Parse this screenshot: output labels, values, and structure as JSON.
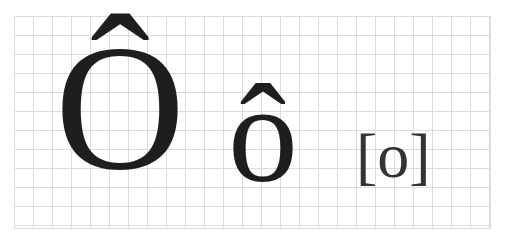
{
  "glyphs": {
    "uppercase": "Ô",
    "lowercase": "ô",
    "ipa": "[o]"
  },
  "colors": {
    "glyph": "#1e1e1e",
    "grid": "#dcdcdc",
    "background": "#ffffff"
  }
}
